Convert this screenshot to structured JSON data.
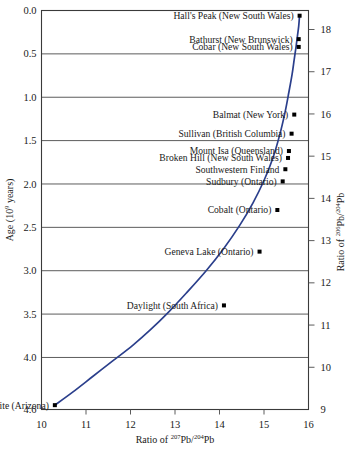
{
  "figure": {
    "title": "",
    "left_axis_title": "Age (10⁹ years)",
    "right_axis_title": "Ratio of ²⁰⁶Pb/²⁰⁴Pb",
    "bottom_axis_title": "Ratio of ²⁰⁷Pb/²⁰⁴Pb"
  },
  "axis_text": {
    "age_label_main": "Age (10",
    "age_label_exp": "9",
    "age_label_tail": " years)",
    "right_label_pre": "Ratio of ",
    "right_label_num": "206",
    "right_label_mid": "Pb/",
    "right_label_den": "204",
    "right_label_post": "Pb",
    "bottom_label_pre": "Ratio of ",
    "bottom_label_num": "207",
    "bottom_label_mid": "Pb/",
    "bottom_label_den": "204",
    "bottom_label_post": "Pb"
  },
  "chart_data": {
    "type": "line",
    "title": "",
    "xlabel": "Ratio of 207Pb/204Pb",
    "ylabel": "Age (10^9 years)",
    "y2label": "Ratio of 206Pb/204Pb",
    "xlim": [
      10,
      16
    ],
    "ylim": [
      0.0,
      4.6
    ],
    "y2lim": [
      9,
      18.45
    ],
    "grid": "horizontal",
    "legend": "none",
    "y_inverted": true,
    "x_ticks": [
      10,
      11,
      12,
      13,
      14,
      15,
      16
    ],
    "x_ticklabels": [
      "10",
      "11",
      "12",
      "13",
      "14",
      "15",
      "16"
    ],
    "y_ticks": [
      0.0,
      0.5,
      1.0,
      1.5,
      2.0,
      2.5,
      3.0,
      3.5,
      4.0,
      4.6
    ],
    "y_ticklabels": [
      "0.0",
      "0.5",
      "1.0",
      "1.5",
      "2.0",
      "2.5",
      "3.0",
      "3.5",
      "4.0",
      "4.6"
    ],
    "y2_ticks": [
      18,
      17,
      16,
      15,
      14,
      13,
      12,
      11,
      10,
      9
    ],
    "y2_ticklabels": [
      "18",
      "17",
      "16",
      "15",
      "14",
      "13",
      "12",
      "11",
      "10",
      "9"
    ],
    "series": [
      {
        "name": "Growth curve (Pb isotope evolution)",
        "color": "#2b3f8c",
        "x": [
          10.3,
          10.7,
          11.15,
          11.6,
          12.05,
          12.45,
          12.85,
          13.25,
          13.7,
          14.1,
          14.45,
          14.75,
          15.0,
          15.2,
          15.35,
          15.47,
          15.56,
          15.63,
          15.68,
          15.72,
          15.75,
          15.78,
          15.8
        ],
        "y": [
          4.55,
          4.4,
          4.22,
          4.04,
          3.86,
          3.68,
          3.48,
          3.26,
          3.0,
          2.74,
          2.48,
          2.22,
          1.96,
          1.7,
          1.44,
          1.18,
          0.94,
          0.74,
          0.56,
          0.42,
          0.3,
          0.18,
          0.05
        ]
      }
    ],
    "points": [
      {
        "label": "Hall's Peak (New South Wales)",
        "x": 15.8,
        "y": 0.06,
        "pb206": 18.4
      },
      {
        "label": "Bathurst (New Brunswick)",
        "x": 15.78,
        "y": 0.33,
        "pb206": 18.2
      },
      {
        "label": "Cobar (New South Wales)",
        "x": 15.78,
        "y": 0.42,
        "pb206": 18.1
      },
      {
        "label": "Balmat (New York)",
        "x": 15.68,
        "y": 1.2,
        "pb206": 17.05
      },
      {
        "label": "Sullivan (British Columbia)",
        "x": 15.62,
        "y": 1.42,
        "pb206": 16.75
      },
      {
        "label": "Mount Isa (Queensland)",
        "x": 15.56,
        "y": 1.62,
        "pb206": 16.48
      },
      {
        "label": "Broken Hill (New South Wales)",
        "x": 15.54,
        "y": 1.7,
        "pb206": 16.38
      },
      {
        "label": "Southwestern Finland",
        "x": 15.48,
        "y": 1.83,
        "pb206": 16.18
      },
      {
        "label": "Sudbury (Ontario)",
        "x": 15.42,
        "y": 1.97,
        "pb206": 15.95
      },
      {
        "label": "Cobalt (Ontario)",
        "x": 15.3,
        "y": 2.3,
        "pb206": 15.2
      },
      {
        "label": "Geneva Lake (Ontario)",
        "x": 14.9,
        "y": 2.78,
        "pb206": 14.2
      },
      {
        "label": "Daylight (South Africa)",
        "x": 14.1,
        "y": 3.4,
        "pb206": 12.55
      },
      {
        "label": "Meteor Crater meteorite (Arizona)",
        "x": 10.3,
        "y": 4.55,
        "pb206": 9.35
      }
    ],
    "annotations": [
      {
        "text": "Hall's Peak (New South Wales)",
        "anchor_x": 15.8,
        "anchor_y": 0.06
      },
      {
        "text": "Bathurst (New Brunswick)",
        "anchor_x": 15.78,
        "anchor_y": 0.33
      },
      {
        "text": "Cobar (New South Wales)",
        "anchor_x": 15.78,
        "anchor_y": 0.42
      },
      {
        "text": "Balmat (New York)",
        "anchor_x": 15.68,
        "anchor_y": 1.2
      },
      {
        "text": "Sullivan (British Columbia)",
        "anchor_x": 15.62,
        "anchor_y": 1.42
      },
      {
        "text": "Mount Isa (Queensland)",
        "anchor_x": 15.56,
        "anchor_y": 1.62
      },
      {
        "text": "Broken Hill (New South Wales)",
        "anchor_x": 15.54,
        "anchor_y": 1.7
      },
      {
        "text": "Southwestern Finland",
        "anchor_x": 15.48,
        "anchor_y": 1.83
      },
      {
        "text": "Sudbury (Ontario)",
        "anchor_x": 15.42,
        "anchor_y": 1.97
      },
      {
        "text": "Cobalt (Ontario)",
        "anchor_x": 15.3,
        "anchor_y": 2.3
      },
      {
        "text": "Geneva Lake (Ontario)",
        "anchor_x": 14.9,
        "anchor_y": 2.78
      },
      {
        "text": "Daylight (South Africa)",
        "anchor_x": 14.1,
        "anchor_y": 3.4
      },
      {
        "text": "Meteor Crater meteorite (Arizona)",
        "anchor_x": 10.3,
        "anchor_y": 4.55
      }
    ]
  }
}
